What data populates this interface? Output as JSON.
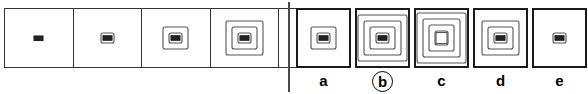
{
  "puzzle": {
    "type": "visual-sequence-analogy",
    "stroke_color": "#555555",
    "frame_color": "#333333",
    "label_color": "#000000",
    "stem": {
      "name": "sequence-row",
      "cells": [
        {
          "id": "stem-1",
          "rings": 0,
          "core": "dash",
          "empty": false
        },
        {
          "id": "stem-2",
          "rings": 1,
          "core": "dash",
          "empty": false
        },
        {
          "id": "stem-3",
          "rings": 2,
          "core": "dash",
          "empty": false
        },
        {
          "id": "stem-4",
          "rings": 3,
          "core": "dash",
          "empty": false
        },
        {
          "id": "stem-5",
          "rings": 0,
          "core": "none",
          "empty": true
        }
      ]
    },
    "options": {
      "name": "answer-options",
      "selected": "b",
      "items": [
        {
          "label": "a",
          "rings": 2,
          "core": "dash",
          "circled": false
        },
        {
          "label": "b",
          "rings": 4,
          "core": "dash",
          "circled": true
        },
        {
          "label": "c",
          "rings": 4,
          "core": "square",
          "circled": false
        },
        {
          "label": "d",
          "rings": 3,
          "core": "dash",
          "circled": false
        },
        {
          "label": "e",
          "rings": 1,
          "core": "dash",
          "circled": false
        }
      ]
    }
  }
}
